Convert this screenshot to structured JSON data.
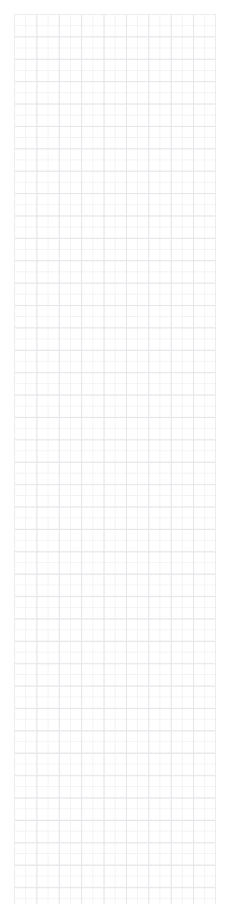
{
  "page": {
    "background_color": "#ffffff",
    "width_px": 227,
    "height_px": 904
  },
  "grid_canvas": {
    "name": "blank-grid-sheet",
    "description": "Empty square-ruled graph paper surface with no content drawn on it",
    "origin_x_px": 14,
    "origin_y_px": 14,
    "width_px": 202,
    "height_px": 890,
    "cell_size_px": 22.4,
    "minor_cell_size_px": 11.2,
    "columns": 9,
    "rows": 40,
    "major_line_color": "#e6e6ea",
    "minor_line_color": "#f3f3f6",
    "border_color": "#ededf0",
    "line_width_px": 1,
    "content": ""
  }
}
